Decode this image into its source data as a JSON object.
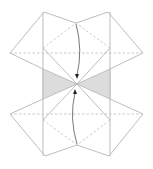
{
  "diagram": {
    "title": "",
    "colors": {
      "line": "#b5b5b5",
      "dashed_line": "#c4c4c4",
      "shade": "#dcdcdc",
      "arrow": "#555555",
      "arrowhead": "#222222"
    },
    "points": {
      "top_left": [
        44,
        12
      ],
      "top_right": [
        108,
        12
      ],
      "top_center": [
        76,
        23
      ],
      "left_outer_upper": [
        10,
        53
      ],
      "right_outer_upper": [
        143,
        53
      ],
      "left_inner_upper": [
        43,
        48
      ],
      "right_inner_upper": [
        110,
        48
      ],
      "center": [
        77,
        84
      ],
      "left_inner_lower": [
        43,
        120
      ],
      "right_inner_lower": [
        110,
        120
      ],
      "left_outer_lower": [
        10,
        114
      ],
      "right_outer_lower": [
        143,
        114
      ],
      "bottom_center": [
        77,
        145
      ],
      "bottom_left": [
        45,
        156
      ],
      "bottom_right": [
        109,
        156
      ]
    },
    "arrows": [
      {
        "name": "upper-fold-arrow",
        "from": [
          76,
          24
        ],
        "to": [
          77,
          77
        ],
        "direction": "down"
      },
      {
        "name": "lower-fold-arrow",
        "from": [
          77,
          144
        ],
        "to": [
          75,
          91
        ],
        "direction": "up"
      }
    ],
    "shaded_regions": [
      {
        "name": "left-shaded-triangle",
        "points": [
          [
            42,
            69
          ],
          [
            42,
            99
          ],
          [
            77,
            84
          ]
        ]
      },
      {
        "name": "right-shaded-triangle",
        "points": [
          [
            111,
            69
          ],
          [
            111,
            99
          ],
          [
            77,
            84
          ]
        ]
      }
    ]
  }
}
